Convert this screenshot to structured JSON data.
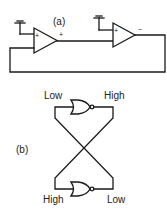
{
  "diagram": {
    "panel_a": {
      "label": "(a)",
      "opamp1": {
        "input_sign": "+",
        "output_sign": "+"
      },
      "opamp2": {
        "input_sign": "+",
        "output_sign": "−"
      }
    },
    "panel_b": {
      "label": "(b)",
      "top_gate": {
        "input_label": "Low",
        "output_label": "High"
      },
      "bottom_gate": {
        "input_label": "High",
        "output_label": "Low"
      }
    },
    "colors": {
      "line": "#1a1a1a",
      "background": "#ffffff"
    }
  }
}
